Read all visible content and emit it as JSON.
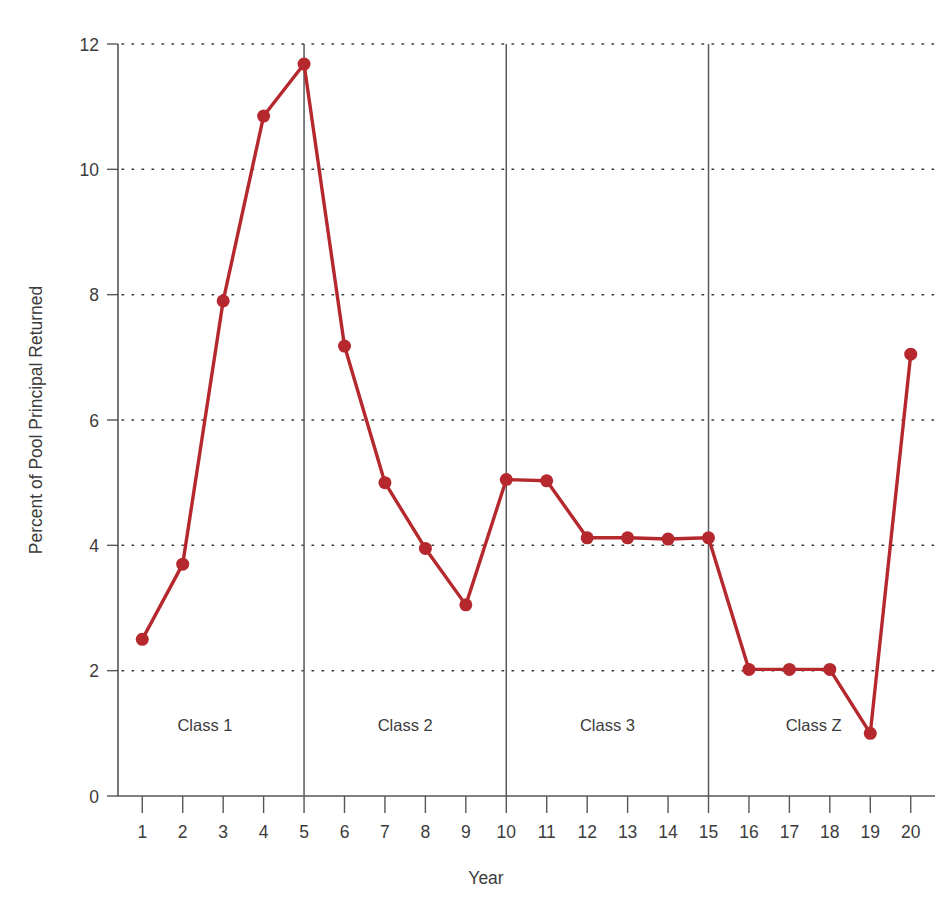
{
  "chart_data": {
    "type": "line",
    "title": "",
    "xlabel": "Year",
    "ylabel": "Percent of Pool Principal Returned",
    "x": [
      1,
      2,
      3,
      4,
      5,
      6,
      7,
      8,
      9,
      10,
      11,
      12,
      13,
      14,
      15,
      16,
      17,
      18,
      19,
      20
    ],
    "values": [
      2.5,
      3.7,
      7.9,
      10.85,
      11.68,
      7.18,
      5.0,
      3.95,
      3.05,
      5.05,
      5.03,
      4.12,
      4.12,
      4.1,
      4.12,
      2.02,
      2.02,
      2.02,
      1.0,
      7.05
    ],
    "series": [
      {
        "name": "Percent of Pool Principal Returned",
        "values": [
          2.5,
          3.7,
          7.9,
          10.85,
          11.68,
          7.18,
          5.0,
          3.95,
          3.05,
          5.05,
          5.03,
          4.12,
          4.12,
          4.1,
          4.12,
          2.02,
          2.02,
          2.02,
          1.0,
          7.05
        ]
      }
    ],
    "xlim": [
      0.4,
      20.6
    ],
    "ylim": [
      0,
      12
    ],
    "x_ticks": [
      "1",
      "2",
      "3",
      "4",
      "5",
      "6",
      "7",
      "8",
      "9",
      "10",
      "11",
      "12",
      "13",
      "14",
      "15",
      "16",
      "17",
      "18",
      "19",
      "20"
    ],
    "y_ticks": [
      "0",
      "2",
      "4",
      "6",
      "8",
      "10",
      "12"
    ],
    "y_tick_values": [
      0,
      2,
      4,
      6,
      8,
      10,
      12
    ],
    "grid": "horizontal-dotted",
    "legend": "none",
    "series_color": "#b5282e",
    "marker": "circle",
    "marker_size": 13,
    "annotations": [
      {
        "label": "Class 1",
        "x_start": 1,
        "x_end": 5,
        "x_center": 2.55,
        "y": 1.0
      },
      {
        "label": "Class 2",
        "x_start": 5,
        "x_end": 10,
        "x_center": 7.5,
        "y": 1.0
      },
      {
        "label": "Class 3",
        "x_start": 10,
        "x_end": 15,
        "x_center": 12.5,
        "y": 1.0
      },
      {
        "label": "Class Z",
        "x_start": 15,
        "x_end": 20,
        "x_center": 17.6,
        "y": 1.0
      }
    ],
    "class_dividers": [
      5,
      10,
      15
    ]
  },
  "colors": {
    "background": "#ffffff",
    "axis": "#53565a",
    "text": "#3c3c3c",
    "series": "#b5282e",
    "grid": "#2f2f2f",
    "divider": "#54585c"
  }
}
